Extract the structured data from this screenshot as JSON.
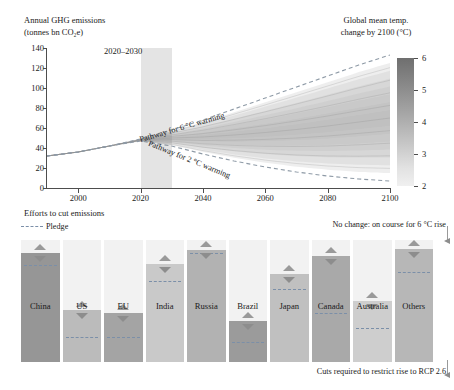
{
  "top": {
    "title_line1": "Annual GHG emissions",
    "title_line2": "(tonnes bn CO₂e)",
    "colorbar_title_line1": "Global mean temp.",
    "colorbar_title_line2": "change by 2100 (°C)",
    "period_label": "2020–2030",
    "pathway_6c_label": "Pathway for 6 °C warming",
    "pathway_2c_label": "Pathway for 2 °C warming"
  },
  "bottom": {
    "title": "Efforts to cut emissions",
    "legend_pledge": "Pledge",
    "annotation_top": "No change: on course for 6 °C rise",
    "annotation_bottom": "Cuts required to restrict rise to RCP 2.6"
  },
  "colors": {
    "pledge_line": "#7b8fa8",
    "axis": "#4d4d4d",
    "band_2030": "rgba(120,120,120,0.20)",
    "marker_up": "#9a9a9a",
    "marker_down": "#8d8d8d"
  },
  "chart_data": [
    {
      "type": "area",
      "title": "Annual GHG emissions (tonnes bn CO₂e)",
      "xlabel": "",
      "ylabel": "tonnes bn CO2e",
      "xlim": [
        1990,
        2100
      ],
      "ylim": [
        0,
        140
      ],
      "xticks": [
        2000,
        2020,
        2040,
        2060,
        2080,
        2100
      ],
      "yticks": [
        0,
        20,
        40,
        60,
        80,
        100,
        120,
        140
      ],
      "grid": false,
      "highlight_span": [
        2020,
        2030
      ],
      "colorbar": {
        "label": "Global mean temp. change by 2100 (°C)",
        "ticks": [
          6,
          5,
          4,
          3,
          2
        ],
        "range": [
          2,
          6
        ],
        "gradient": "grayscale-dark-top-to-light-bottom"
      },
      "series": [
        {
          "name": "Pathway for 6 °C warming",
          "style": "dashed",
          "x": [
            1990,
            2000,
            2010,
            2020,
            2030,
            2040,
            2050,
            2060,
            2070,
            2080,
            2090,
            2100
          ],
          "values": [
            32,
            36,
            42,
            49,
            58,
            68,
            79,
            90,
            101,
            112,
            123,
            133
          ]
        },
        {
          "name": "Pathway for 2 °C warming",
          "style": "dashed",
          "x": [
            1990,
            2000,
            2010,
            2020,
            2030,
            2040,
            2050,
            2060,
            2070,
            2080,
            2090,
            2100
          ],
          "values": [
            32,
            36,
            42,
            47,
            42,
            34,
            27,
            21,
            16,
            12,
            9,
            7
          ]
        },
        {
          "name": "fan-band-upper-edge",
          "style": "band",
          "x": [
            1990,
            2020,
            2060,
            2100
          ],
          "values": [
            34,
            45,
            62,
            78
          ]
        },
        {
          "name": "fan-band-mid",
          "style": "solid",
          "x": [
            1990,
            2020,
            2060,
            2100
          ],
          "values": [
            30,
            40,
            53,
            64
          ]
        },
        {
          "name": "fan-band-lower-edge",
          "style": "band",
          "x": [
            1990,
            2020,
            2060,
            2100
          ],
          "values": [
            22,
            27,
            32,
            36
          ]
        }
      ]
    },
    {
      "type": "bar",
      "title": "Efforts to cut emissions",
      "xlabel": "",
      "ylabel": "",
      "grid": false,
      "categories": [
        "China",
        "US",
        "EU",
        "India",
        "Russia",
        "Brazil",
        "Japan",
        "Canada",
        "Australia",
        "Others"
      ],
      "series": [
        {
          "name": "Current emissions (bar height, relative)",
          "values": [
            100,
            48,
            45,
            90,
            103,
            38,
            81,
            97,
            56,
            104
          ]
        },
        {
          "name": "Pledge (dashed line level, relative)",
          "values": [
            88,
            22,
            22,
            73,
            99,
            17,
            66,
            44,
            30,
            82
          ]
        }
      ],
      "markers": {
        "up_triangle": "increase marker above bar top",
        "down_triangle": "decrease marker below bar top"
      },
      "annotations": [
        "No change: on course for 6 °C rise",
        "Cuts required to restrict rise to RCP 2.6"
      ]
    }
  ]
}
